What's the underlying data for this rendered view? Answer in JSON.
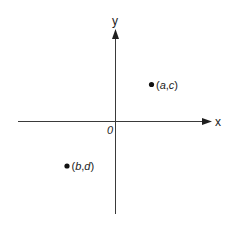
{
  "diagram": {
    "type": "coordinate-plane",
    "axes": {
      "x_label": "x",
      "y_label": "y",
      "origin_label": "0"
    },
    "points": [
      {
        "name": "point-a-c",
        "label_open": "(",
        "var1": "a",
        "sep": ",",
        "var2": "c",
        "label_close": ")",
        "quadrant": "I"
      },
      {
        "name": "point-b-d",
        "label_open": "(",
        "var1": "b",
        "sep": ",",
        "var2": "d",
        "label_close": ")",
        "quadrant": "III"
      }
    ]
  }
}
